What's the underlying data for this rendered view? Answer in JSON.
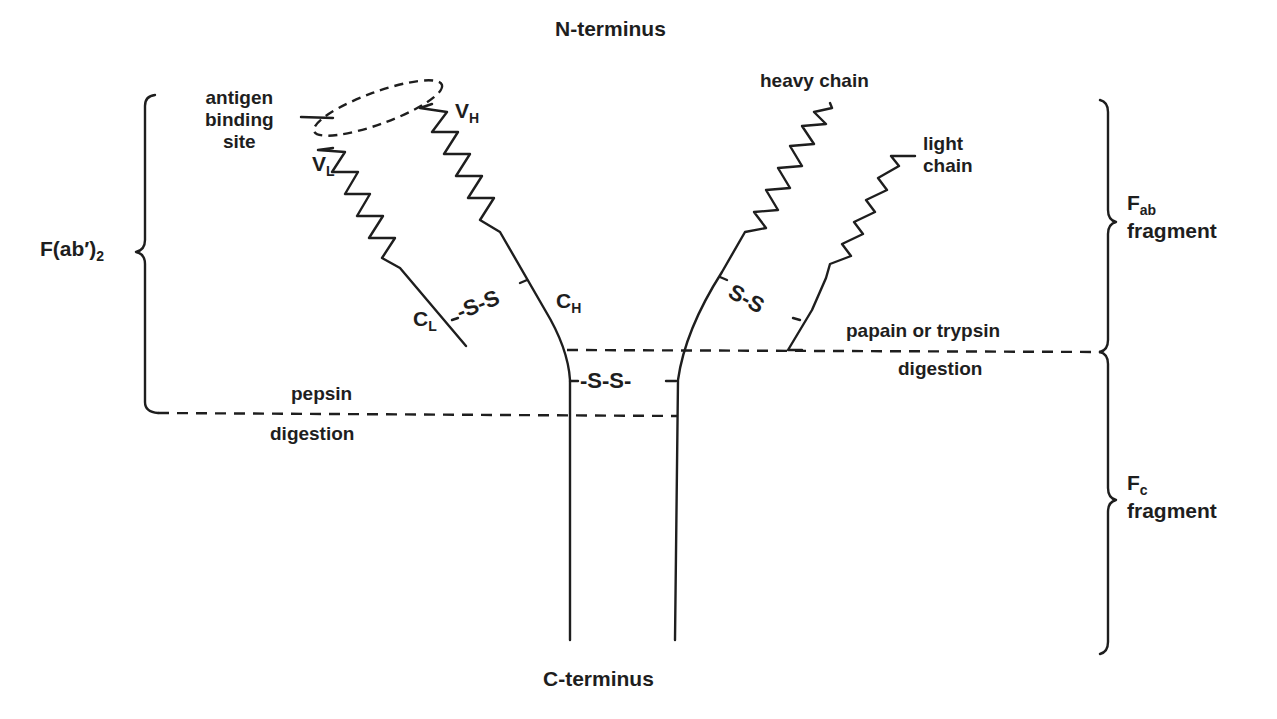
{
  "diagram": {
    "title_top": "N-terminus",
    "title_bottom": "C-terminus",
    "labels": {
      "antigen_binding_site": [
        "antigen",
        "binding",
        "site"
      ],
      "vh": {
        "main": "V",
        "sub": "H"
      },
      "vl": {
        "main": "V",
        "sub": "L"
      },
      "ch": {
        "main": "C",
        "sub": "H"
      },
      "cl": {
        "main": "C",
        "sub": "L"
      },
      "heavy_chain": "heavy chain",
      "light_chain": [
        "light",
        "chain"
      ],
      "disulfide_left": "-S-S",
      "disulfide_right": "S-S",
      "disulfide_hinge": "-S-S-",
      "pepsin": "pepsin",
      "pepsin_digestion": "digestion",
      "papain": "papain or trypsin",
      "papain_digestion": "digestion",
      "fab2": {
        "main": "F(ab′)",
        "sub": "2"
      },
      "fab": {
        "main": "F",
        "sub": "ab",
        "line2": "fragment"
      },
      "fc": {
        "main": "F",
        "sub": "c",
        "line2": "fragment"
      }
    },
    "colors": {
      "ink": "#1e1e1e",
      "background": "#ffffff"
    }
  }
}
